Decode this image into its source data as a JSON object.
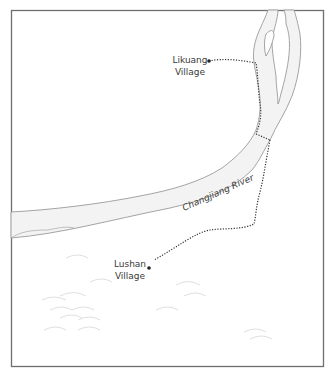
{
  "map": {
    "river": {
      "name": "Changjiang River",
      "fill": "#f3f3f3",
      "stroke": "#9a9a9a"
    },
    "villages": [
      {
        "name_line1": "Likuang",
        "name_line2": "Village"
      },
      {
        "name_line1": "Lushan",
        "name_line2": "Village"
      }
    ],
    "frame_color": "#6e6e6e",
    "path_color": "#333333",
    "hill_color": "#e2e2e2"
  }
}
